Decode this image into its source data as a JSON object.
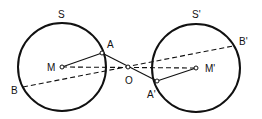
{
  "diagram": {
    "circles": [
      {
        "id": "S",
        "label": "S",
        "cx": 62,
        "cy": 67,
        "r": 44,
        "label_x": 58,
        "label_y": 18
      },
      {
        "id": "S_prime",
        "label": "S'",
        "cx": 196,
        "cy": 68,
        "r": 44,
        "label_x": 192,
        "label_y": 18
      }
    ],
    "points": [
      {
        "id": "M",
        "label": "M",
        "x": 62,
        "y": 67,
        "label_x": 47,
        "label_y": 71
      },
      {
        "id": "M_prime",
        "label": "M'",
        "x": 196,
        "y": 68,
        "label_x": 205,
        "label_y": 72
      },
      {
        "id": "O",
        "label": "O",
        "x": 128,
        "y": 67,
        "label_x": 125,
        "label_y": 84
      },
      {
        "id": "A",
        "label": "A",
        "x": 102,
        "y": 53,
        "label_x": 107,
        "label_y": 48
      },
      {
        "id": "A_prime",
        "label": "A'",
        "x": 157,
        "y": 81,
        "label_x": 147,
        "label_y": 98
      },
      {
        "id": "B",
        "label": "B",
        "x": 23,
        "y": 87,
        "label_x": 11,
        "label_y": 94
      },
      {
        "id": "B_prime",
        "label": "B'",
        "x": 233,
        "y": 46,
        "label_x": 239,
        "label_y": 45
      }
    ],
    "segments": [
      {
        "from": "M",
        "to": "A",
        "style": "solid"
      },
      {
        "from": "A",
        "to": "A_prime",
        "style": "solid"
      },
      {
        "from": "A_prime",
        "to": "M_prime",
        "style": "solid"
      },
      {
        "from": "M",
        "to": "M_prime",
        "style": "dashed"
      },
      {
        "from": "B",
        "to": "B_prime",
        "style": "dashed"
      }
    ],
    "colors": {
      "stroke": "#111111",
      "background": "#ffffff"
    }
  }
}
